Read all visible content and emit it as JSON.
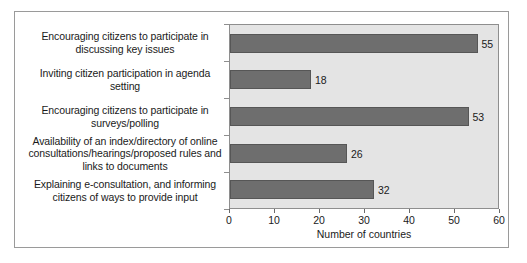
{
  "chart_data": {
    "type": "bar",
    "orientation": "horizontal",
    "title": "",
    "xlabel": "Number of countries",
    "ylabel": "",
    "xlim": [
      0,
      60
    ],
    "xticks": [
      0,
      10,
      20,
      30,
      40,
      50,
      60
    ],
    "grid": false,
    "legend": false,
    "bar_color": "#6e6e6e",
    "plot_background": "#e4e4e4",
    "categories": [
      "Encouraging  citizens to participate in\ndiscussing key issues",
      "Inviting citizen participation in agenda\nsetting",
      "Encouraging citizens to participate in\nsurveys/polling",
      "Availability of an index/directory of online\nconsultations/hearings/proposed rules and\nlinks to documents",
      "Explaining e-consultation, and informing\ncitizens of ways to provide input"
    ],
    "values": [
      55,
      18,
      53,
      26,
      32
    ],
    "data_labels": [
      "55",
      "18",
      "53",
      "26",
      "32"
    ]
  }
}
